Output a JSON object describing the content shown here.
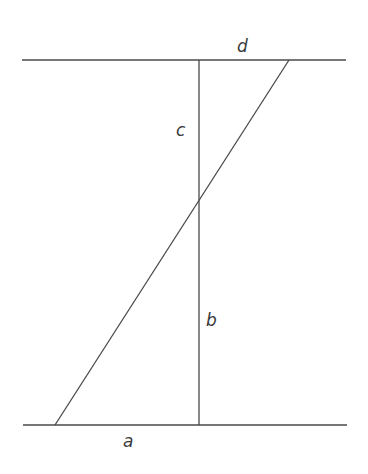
{
  "diagram": {
    "type": "geometry",
    "colors": {
      "background": "#ffffff",
      "stroke": "#4a4a4a",
      "text": "#3a3a3a"
    },
    "lines": {
      "top": {
        "x1": 22,
        "y1": 60,
        "x2": 346,
        "y2": 60
      },
      "bottom": {
        "x1": 23,
        "y1": 425,
        "x2": 347,
        "y2": 425
      },
      "vertical": {
        "x1": 199,
        "y1": 60,
        "x2": 199,
        "y2": 425
      },
      "diagonal": {
        "x1": 289,
        "y1": 60,
        "x2": 55,
        "y2": 425
      }
    },
    "labels": {
      "a": "a",
      "b": "b",
      "c": "c",
      "d": "d"
    }
  }
}
